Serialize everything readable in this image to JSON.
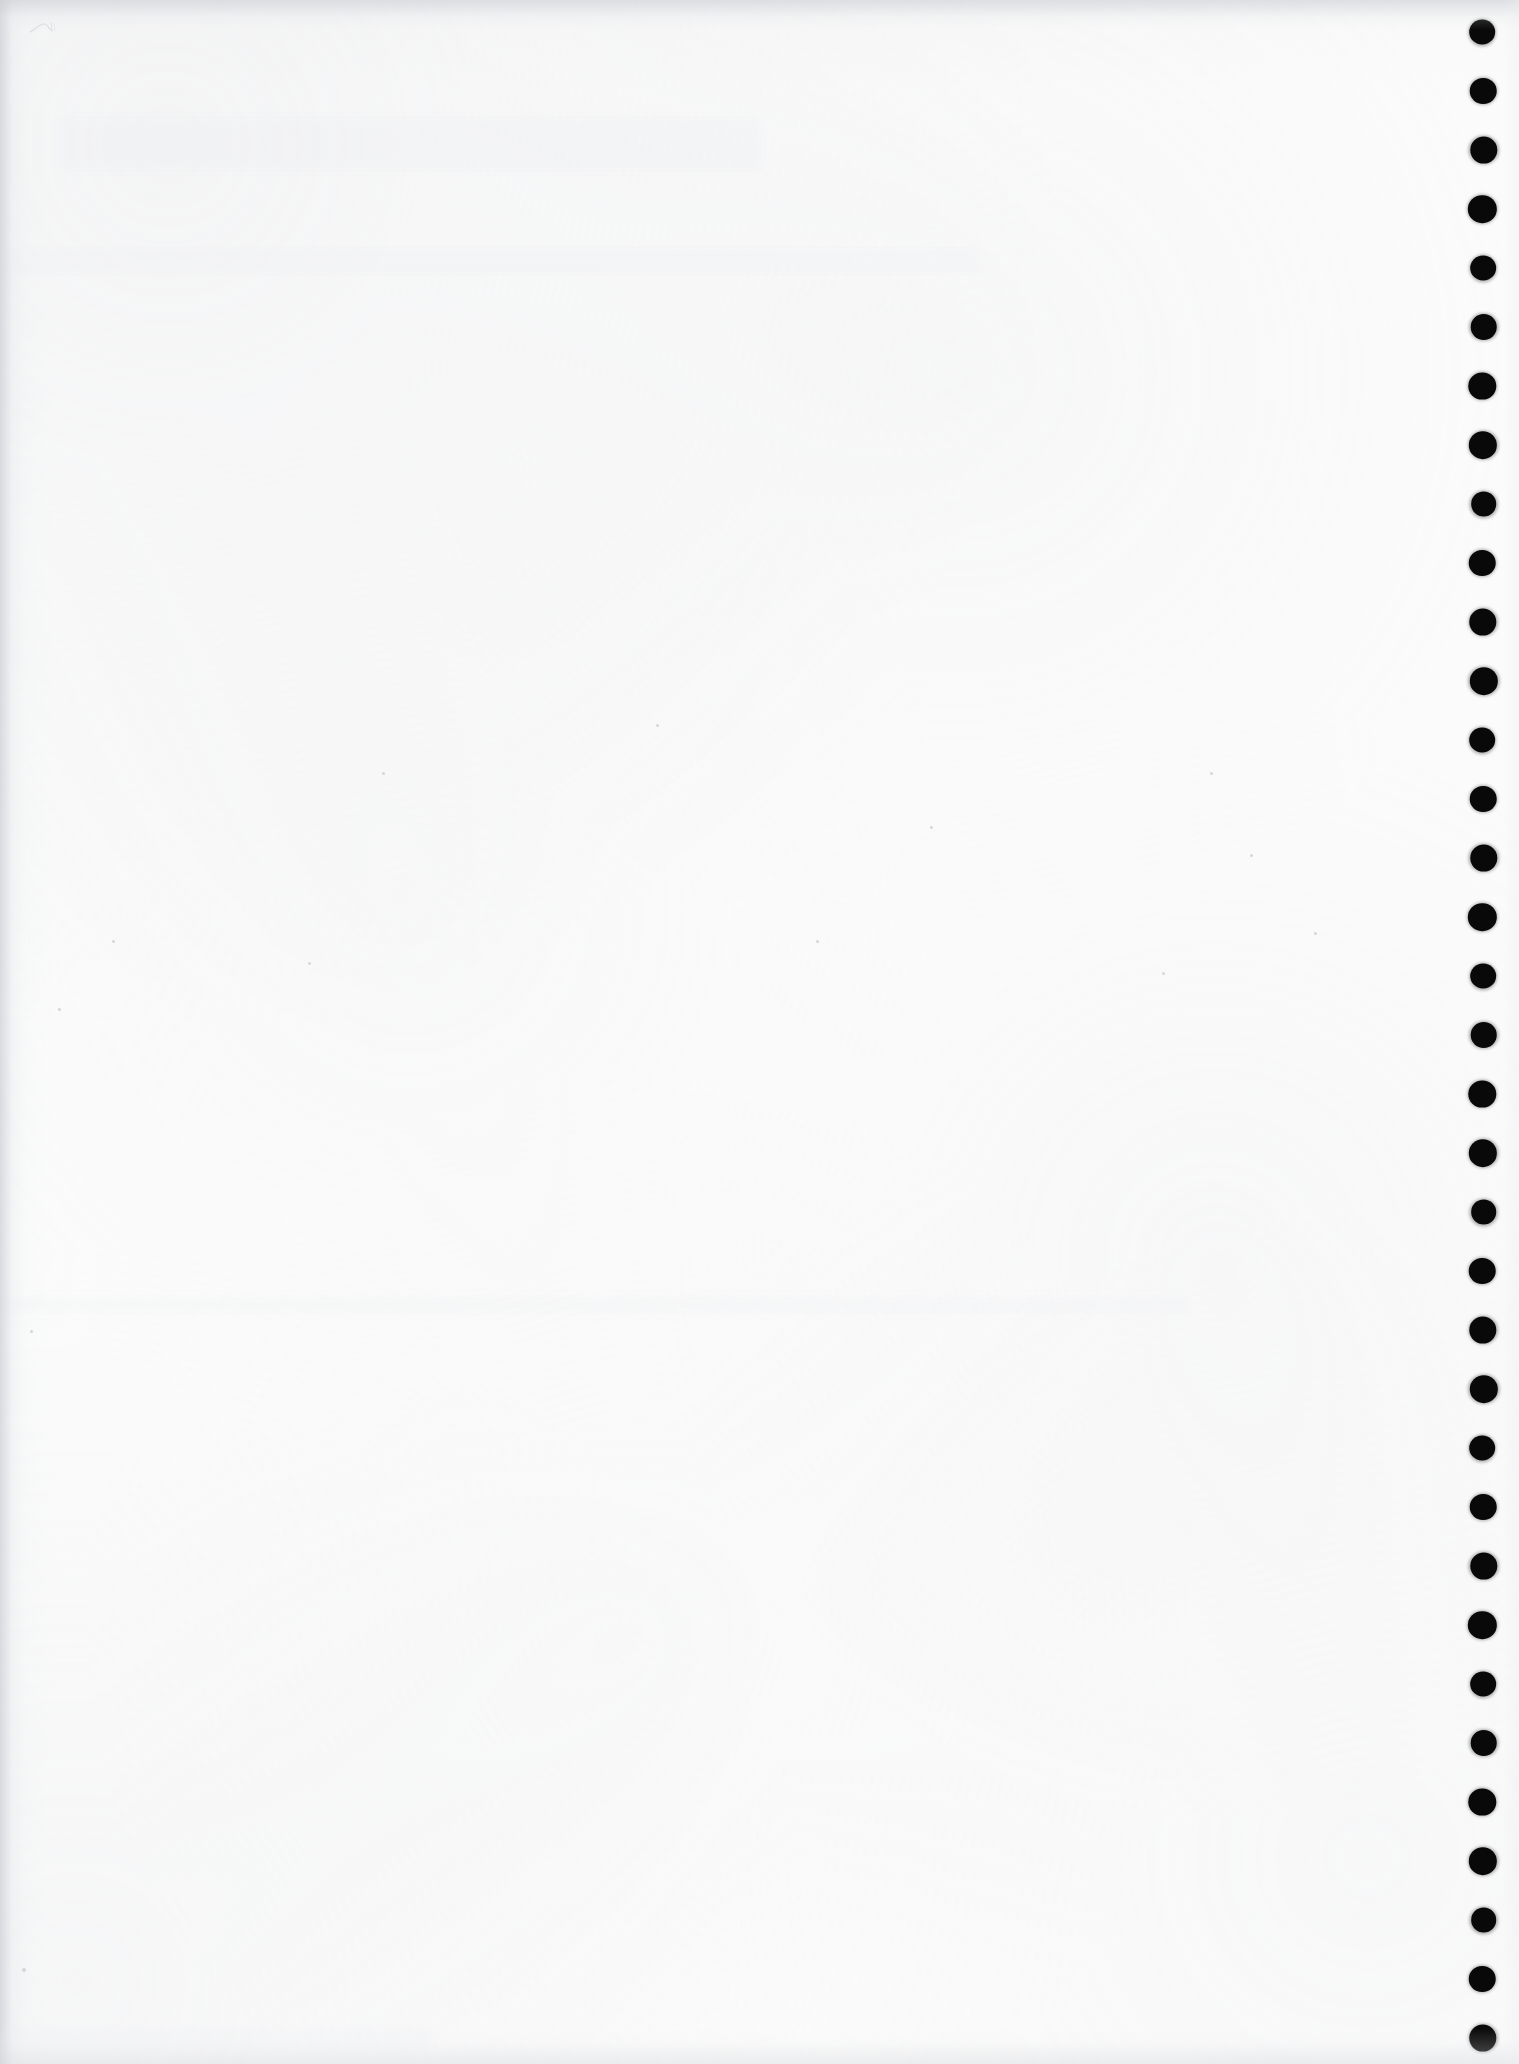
{
  "document": {
    "kind": "scanned-page",
    "title": "Blank scanned page",
    "page_width_px": 1519,
    "page_height_px": 2064,
    "visible_text": "",
    "notes": "No legible text, headings, captions or figures are rendered on this page."
  },
  "paper": {
    "base_color": "#fdfdfd",
    "shadow_color": "#c6c9ce",
    "grain_color": "#e6e8eb",
    "ghost_color": "#ebedf0"
  },
  "punch_marks": {
    "label": "punch-hole marks",
    "color": "#080808",
    "count": 35,
    "diameter_px": 27,
    "spacing_px": 59,
    "center_x_px": 1483,
    "first_center_y_px": 32,
    "centers_y_px": [
      32,
      91,
      150,
      209,
      268,
      327,
      386,
      445,
      504,
      563,
      622,
      681,
      740,
      799,
      858,
      917,
      976,
      1035,
      1094,
      1153,
      1212,
      1271,
      1330,
      1389,
      1448,
      1507,
      1566,
      1625,
      1684,
      1743,
      1802,
      1861,
      1920,
      1979,
      2038
    ]
  },
  "annotations": {
    "pencil_mark": {
      "label": "faint pencil squiggle",
      "x_px": 28,
      "y_px": 18,
      "width_px": 34,
      "height_px": 20,
      "color": "#b9bdc4"
    }
  },
  "specks": [
    {
      "x": 382,
      "y": 772,
      "size": 3
    },
    {
      "x": 656,
      "y": 724,
      "size": 3
    },
    {
      "x": 930,
      "y": 826,
      "size": 3
    },
    {
      "x": 1210,
      "y": 772,
      "size": 3
    },
    {
      "x": 1250,
      "y": 854,
      "size": 3
    },
    {
      "x": 1314,
      "y": 932,
      "size": 3
    },
    {
      "x": 112,
      "y": 940,
      "size": 3
    },
    {
      "x": 308,
      "y": 962,
      "size": 3
    },
    {
      "x": 816,
      "y": 940,
      "size": 3
    },
    {
      "x": 1162,
      "y": 972,
      "size": 3
    },
    {
      "x": 58,
      "y": 1008,
      "size": 3
    },
    {
      "x": 30,
      "y": 1330,
      "size": 3
    },
    {
      "x": 1490,
      "y": 210,
      "size": 3
    },
    {
      "x": 22,
      "y": 1968,
      "size": 4
    }
  ]
}
